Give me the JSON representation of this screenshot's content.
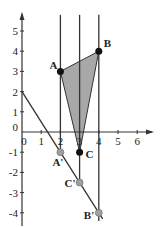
{
  "chart_data": {
    "type": "diagram",
    "title": "",
    "x_ticks": [
      "0",
      "1",
      "2",
      "3",
      "4",
      "5",
      "6"
    ],
    "y_ticks": [
      "5",
      "4",
      "3",
      "2",
      "1",
      "-1",
      "-2",
      "-3",
      "-4"
    ],
    "origin_label": "0",
    "xlim": [
      0,
      6.5
    ],
    "ylim": [
      -4.2,
      5.5
    ],
    "triangle": {
      "fill": "#a8a8a8",
      "vertices": [
        {
          "label": "A",
          "x": 2,
          "y": 3
        },
        {
          "label": "B",
          "x": 4,
          "y": 4
        },
        {
          "label": "C",
          "x": 3,
          "y": -1
        }
      ]
    },
    "projected_points": [
      {
        "label": "A'",
        "x": 2,
        "y": -1
      },
      {
        "label": "C'",
        "x": 3,
        "y": -2.5
      },
      {
        "label": "B'",
        "x": 4,
        "y": -4
      }
    ],
    "line": {
      "slope": -1.5,
      "intercept": 2,
      "x_range": [
        0,
        4.2
      ]
    },
    "vertical_lines": [
      {
        "x": 2,
        "y_from": 5.8,
        "y_to": -1
      },
      {
        "x": 3,
        "y_from": 5.8,
        "y_to": -2.5
      },
      {
        "x": 4,
        "y_from": 5.8,
        "y_to": -4.4
      }
    ],
    "colors": {
      "point": "#111111",
      "projected_point": "#a0a0a0",
      "line": "#333333"
    }
  }
}
